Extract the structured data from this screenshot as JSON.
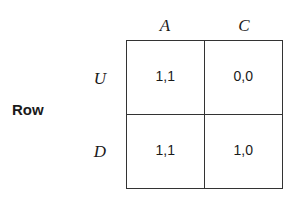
{
  "figure": {
    "type": "payoff-matrix",
    "row_player_label": "Row",
    "column_headers": [
      "A",
      "C"
    ],
    "row_headers": [
      "U",
      "D"
    ],
    "cells": [
      [
        {
          "row": "U",
          "column": "A",
          "payoff": "1,1"
        },
        {
          "row": "U",
          "column": "C",
          "payoff": "0,0"
        }
      ],
      [
        {
          "row": "D",
          "column": "A",
          "payoff": "1,1"
        },
        {
          "row": "D",
          "column": "C",
          "payoff": "1,0"
        }
      ]
    ],
    "colors": {
      "border": "#333333",
      "text": "#1a1a1a",
      "background": "#ffffff"
    }
  }
}
